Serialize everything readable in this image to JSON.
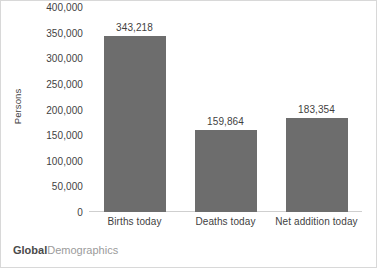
{
  "chart_data": {
    "type": "bar",
    "title": "",
    "xlabel": "",
    "ylabel": "Persons",
    "categories": [
      "Births today",
      "Deaths today",
      "Net addition today"
    ],
    "values": [
      343218,
      159864,
      183354
    ],
    "data_labels": [
      "343,218",
      "159,864",
      "183,354"
    ],
    "ylim": [
      0,
      400000
    ],
    "ytick_values": [
      400000,
      350000,
      300000,
      250000,
      200000,
      150000,
      100000,
      50000,
      0
    ],
    "ytick_labels": [
      "400,000",
      "350,000",
      "300,000",
      "250,000",
      "200,000",
      "150,000",
      "100,000",
      "50,000",
      "0"
    ],
    "grid": false,
    "legend": "none",
    "bar_color": "#6d6d6d",
    "text_color": "#3f3f3f",
    "axis_color": "#cfcfcf",
    "border_color": "#d8d8d8",
    "background": "#ffffff"
  },
  "branding": {
    "primary": "Global",
    "secondary": "Demographics",
    "primary_color": "#4a4a4a",
    "secondary_color": "#9b9b9b"
  }
}
